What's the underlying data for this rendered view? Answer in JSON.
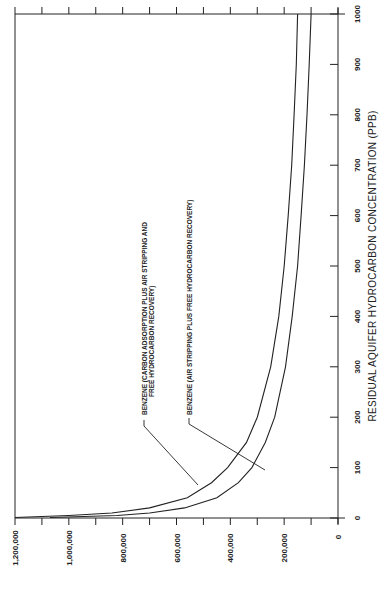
{
  "chart_data": {
    "type": "line",
    "title": "",
    "orientation": "rotated 90 degrees counter-clockwise",
    "xlabel": "RESIDUAL AQUIFER HYDROCARBON CONCENTRATION (PPB)",
    "ylabel": "",
    "x_ticks": [
      "0",
      "100",
      "200",
      "300",
      "400",
      "500",
      "600",
      "700",
      "800",
      "900",
      "1000"
    ],
    "y_ticks": [
      "0",
      "200,000",
      "400,000",
      "600,000",
      "800,000",
      "1,000,000",
      "1,200,000"
    ],
    "xlim": [
      0,
      1000
    ],
    "ylim": [
      0,
      1200000
    ],
    "grid": false,
    "series": [
      {
        "name": "BENZENE (CARBON ADSORPTION PLUS AIR STRIPPING AND FREE HYDROCARBON RECOVERY)",
        "annotation_lines": [
          "BENZENE (CARBON ADSORPTION PLUS AIR STRIPPING AND",
          "FREE HYDROCARBON RECOVERY)"
        ],
        "x": [
          1,
          5,
          10,
          20,
          40,
          70,
          100,
          150,
          200,
          300,
          400,
          500,
          600,
          700,
          800,
          900,
          1000
        ],
        "values": [
          1200000,
          1000000,
          840000,
          700000,
          560000,
          470000,
          410000,
          340000,
          300000,
          250000,
          220000,
          200000,
          185000,
          172000,
          163000,
          155000,
          150000
        ]
      },
      {
        "name": "BENZENE (AIR STRIPPING PLUS FREE HYDROCARBON RECOVERY)",
        "annotation_lines": [
          "BENZENE (AIR STRIPPING PLUS FREE HYDROCARBON RECOVERY)"
        ],
        "x": [
          1,
          5,
          10,
          20,
          40,
          70,
          100,
          150,
          200,
          300,
          400,
          500,
          600,
          700,
          800,
          900,
          1000
        ],
        "values": [
          1070000,
          820000,
          700000,
          570000,
          450000,
          370000,
          320000,
          270000,
          235000,
          195000,
          170000,
          150000,
          137000,
          125000,
          115000,
          107000,
          100000
        ]
      }
    ]
  }
}
